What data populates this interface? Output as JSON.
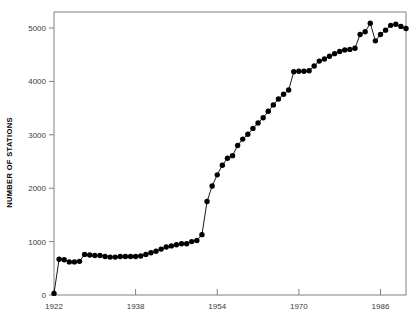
{
  "chart_data": {
    "type": "line",
    "title": "",
    "subtitle": "",
    "xlabel": "",
    "ylabel": "NUMBER OF STATIONS",
    "xlim": [
      1922,
      1991
    ],
    "ylim": [
      0,
      5300
    ],
    "xticks": [
      1922,
      1938,
      1954,
      1970,
      1986
    ],
    "xtick_labels": [
      "1922",
      "1938",
      "1954",
      "1970",
      "1986"
    ],
    "yticks": [
      0,
      1000,
      2000,
      3000,
      4000,
      5000
    ],
    "ytick_labels": [
      "0",
      "1000",
      "2000",
      "3000",
      "4000",
      "5000"
    ],
    "grid": false,
    "legend": null,
    "marker": "filled-circle",
    "marker_color": "#000000",
    "line_color": "#000000",
    "axis_color": "#808080",
    "series": [
      {
        "name": "Number of stations",
        "x": [
          1922,
          1923,
          1924,
          1925,
          1926,
          1927,
          1928,
          1929,
          1930,
          1931,
          1932,
          1933,
          1934,
          1935,
          1936,
          1937,
          1938,
          1939,
          1940,
          1941,
          1942,
          1943,
          1944,
          1945,
          1946,
          1947,
          1948,
          1949,
          1950,
          1951,
          1952,
          1953,
          1954,
          1955,
          1956,
          1957,
          1958,
          1959,
          1960,
          1961,
          1962,
          1963,
          1964,
          1965,
          1966,
          1967,
          1968,
          1969,
          1970,
          1971,
          1972,
          1973,
          1974,
          1975,
          1976,
          1977,
          1978,
          1979,
          1980,
          1981,
          1982,
          1983,
          1984,
          1985,
          1986,
          1987,
          1988,
          1989,
          1990,
          1991
        ],
        "y": [
          30,
          670,
          660,
          620,
          620,
          630,
          760,
          750,
          740,
          740,
          720,
          710,
          710,
          720,
          720,
          720,
          720,
          730,
          760,
          790,
          820,
          860,
          900,
          920,
          940,
          960,
          960,
          1000,
          1020,
          1130,
          1750,
          2040,
          2250,
          2430,
          2560,
          2610,
          2800,
          2920,
          3010,
          3120,
          3220,
          3320,
          3440,
          3560,
          3670,
          3760,
          3840,
          4180,
          4190,
          4190,
          4200,
          4290,
          4380,
          4420,
          4470,
          4520,
          4560,
          4590,
          4600,
          4620,
          4880,
          4930,
          5090,
          4760,
          4880,
          4960,
          5050,
          5070,
          5030,
          4990
        ]
      }
    ]
  },
  "plot": {
    "left_px": 54,
    "right_px": 406,
    "top_px": 12,
    "bottom_px": 295
  }
}
